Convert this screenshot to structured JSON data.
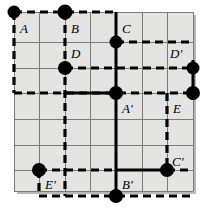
{
  "figure": {
    "type": "geometric-lattice-diagram",
    "colors": {
      "background": "#ffffff",
      "grid_fill": "#e4e4e2",
      "grid_line": "#6e6e6e",
      "heavy_line": "#000000",
      "dot": "#000000",
      "shadow": "#b8b8b4"
    },
    "grid": {
      "columns": 7,
      "rows": 7,
      "left": 14,
      "top": 12,
      "cell": 25.6,
      "right": 193,
      "bottom": 191
    },
    "labels": [
      {
        "name": "A",
        "text": "A",
        "x": 20,
        "y": 33
      },
      {
        "name": "B",
        "text": "B",
        "x": 71,
        "y": 33
      },
      {
        "name": "C",
        "text": "C",
        "x": 122,
        "y": 33
      },
      {
        "name": "D",
        "text": "D",
        "x": 71,
        "y": 58
      },
      {
        "name": "Dp",
        "text": "D′",
        "x": 172,
        "y": 58
      },
      {
        "name": "Ap",
        "text": "A′",
        "x": 122,
        "y": 110
      },
      {
        "name": "E",
        "text": "E",
        "x": 173,
        "y": 110
      },
      {
        "name": "Cp",
        "text": "C′",
        "x": 173,
        "y": 168
      },
      {
        "name": "Ep",
        "text": "E′",
        "x": 46,
        "y": 187
      },
      {
        "name": "Bp",
        "text": "B′",
        "x": 122,
        "y": 187
      }
    ],
    "dots": [
      {
        "name": "dot-A",
        "x": 14,
        "y": 12,
        "r": 6.5
      },
      {
        "name": "dot-B",
        "x": 65,
        "y": 12,
        "r": 7.5
      },
      {
        "name": "dot-C",
        "x": 116,
        "y": 42,
        "r": 6.5
      },
      {
        "name": "dot-D",
        "x": 65,
        "y": 68,
        "r": 7.0
      },
      {
        "name": "dot-Dp",
        "x": 193,
        "y": 68,
        "r": 6.5
      },
      {
        "name": "dot-Ap",
        "x": 116,
        "y": 93,
        "r": 7.0
      },
      {
        "name": "dot-E",
        "x": 193,
        "y": 93,
        "r": 7.0
      },
      {
        "name": "dot-Cp",
        "x": 167,
        "y": 170,
        "r": 7.0
      },
      {
        "name": "dot-Ep",
        "x": 39,
        "y": 170,
        "r": 7.0
      },
      {
        "name": "dot-Bp",
        "x": 116,
        "y": 196,
        "r": 7.0
      }
    ],
    "solid_segments": [
      {
        "name": "seg-C-vertical",
        "x1": 116,
        "y1": 12,
        "x2": 116,
        "y2": 93
      },
      {
        "name": "seg-Ap-vertical",
        "x1": 116,
        "y1": 93,
        "x2": 116,
        "y2": 196
      },
      {
        "name": "seg-Ap-left",
        "x1": 65,
        "y1": 93,
        "x2": 116,
        "y2": 93
      },
      {
        "name": "seg-Cp-left",
        "x1": 116,
        "y1": 170,
        "x2": 167,
        "y2": 170
      },
      {
        "name": "seg-E-right",
        "x1": 193,
        "y1": 68,
        "x2": 193,
        "y2": 93
      }
    ],
    "dashed_segments": [
      {
        "name": "dash-top",
        "x1": 14,
        "y1": 12,
        "x2": 116,
        "y2": 12
      },
      {
        "name": "dash-left",
        "x1": 14,
        "y1": 12,
        "x2": 14,
        "y2": 93
      },
      {
        "name": "dash-B-vertical",
        "x1": 65,
        "y1": 12,
        "x2": 65,
        "y2": 196
      },
      {
        "name": "dash-D-row",
        "x1": 65,
        "y1": 68,
        "x2": 193,
        "y2": 68
      },
      {
        "name": "dash-Ap-row",
        "x1": 14,
        "y1": 93,
        "x2": 193,
        "y2": 93
      },
      {
        "name": "dash-Cp-vert",
        "x1": 167,
        "y1": 93,
        "x2": 167,
        "y2": 170
      },
      {
        "name": "dash-Cp-right",
        "x1": 167,
        "y1": 170,
        "x2": 193,
        "y2": 170
      },
      {
        "name": "dash-Ep-row",
        "x1": 39,
        "y1": 170,
        "x2": 116,
        "y2": 170
      },
      {
        "name": "dash-bottom",
        "x1": 39,
        "y1": 196,
        "x2": 193,
        "y2": 196
      },
      {
        "name": "dash-Dp-row",
        "x1": 116,
        "y1": 42,
        "x2": 193,
        "y2": 42
      },
      {
        "name": "dash-Ep-vert",
        "x1": 39,
        "y1": 170,
        "x2": 39,
        "y2": 196
      }
    ]
  }
}
